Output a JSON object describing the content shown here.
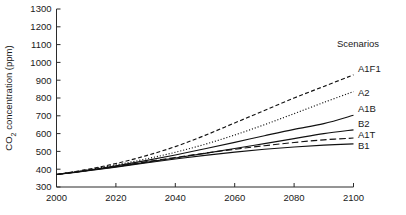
{
  "chart_data": {
    "type": "line",
    "title": "",
    "xlabel": "",
    "ylabel": "CO2 concentration (ppm)",
    "ylabel_display": "CO₂ concentration (ppm)",
    "xlim": [
      2000,
      2100
    ],
    "ylim": [
      300,
      1300
    ],
    "xticks": [
      2000,
      2020,
      2040,
      2060,
      2080,
      2100
    ],
    "xtick_labels": [
      "2000",
      "2020",
      "2040",
      "2060",
      "2080",
      "2100"
    ],
    "yticks": [
      300,
      400,
      500,
      600,
      700,
      800,
      900,
      1000,
      1100,
      1200,
      1300
    ],
    "ytick_labels": [
      "300",
      "400",
      "500",
      "600",
      "700",
      "800",
      "900",
      "1000",
      "1100",
      "1200",
      "1300"
    ],
    "grid": false,
    "legend_position": "right-inline",
    "legend_title": "Scenarios",
    "x": [
      2000,
      2010,
      2020,
      2030,
      2040,
      2050,
      2060,
      2070,
      2080,
      2090,
      2100
    ],
    "series": [
      {
        "name": "A1F1",
        "label": "A1F1",
        "style": "dashed",
        "color": "#111111",
        "values": [
          370,
          398,
          432,
          475,
          527,
          590,
          660,
          730,
          800,
          865,
          930
        ]
      },
      {
        "name": "A2",
        "label": "A2",
        "style": "dotted",
        "color": "#111111",
        "values": [
          370,
          395,
          424,
          457,
          495,
          540,
          592,
          650,
          712,
          775,
          836
        ]
      },
      {
        "name": "A1B",
        "label": "A1B",
        "style": "solid",
        "color": "#111111",
        "values": [
          370,
          393,
          419,
          448,
          480,
          515,
          551,
          588,
          624,
          656,
          703
        ]
      },
      {
        "name": "B2",
        "label": "B2",
        "style": "solid",
        "color": "#111111",
        "values": [
          370,
          391,
          414,
          438,
          463,
          489,
          516,
          544,
          572,
          600,
          621
        ]
      },
      {
        "name": "A1T",
        "label": "A1T",
        "style": "longdash",
        "color": "#111111",
        "values": [
          370,
          392,
          416,
          441,
          466,
          490,
          512,
          532,
          550,
          565,
          575
        ]
      },
      {
        "name": "B1",
        "label": "B1",
        "style": "solid",
        "color": "#111111",
        "values": [
          370,
          390,
          412,
          435,
          457,
          478,
          496,
          512,
          525,
          535,
          542
        ]
      }
    ]
  }
}
